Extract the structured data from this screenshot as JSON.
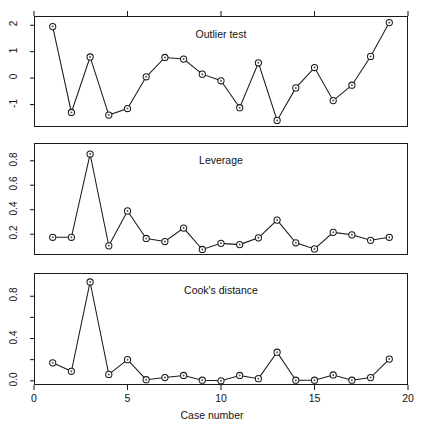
{
  "figure": {
    "xlabel": "Case number",
    "panels": [
      {
        "title": "Outlier test",
        "name": "outlier-test"
      },
      {
        "title": "Leverage",
        "name": "leverage"
      },
      {
        "title": "Cook's distance",
        "name": "cooks-distance"
      }
    ]
  },
  "chart_data": [
    {
      "type": "line",
      "title": "Outlier test",
      "xlabel": "",
      "ylabel": "",
      "x": [
        1,
        2,
        3,
        4,
        5,
        6,
        7,
        8,
        9,
        10,
        11,
        12,
        13,
        14,
        15,
        16,
        17,
        18,
        19
      ],
      "values": [
        1.95,
        -1.3,
        0.8,
        -1.4,
        -1.15,
        0.05,
        0.78,
        0.72,
        0.15,
        -0.1,
        -1.12,
        0.58,
        -1.6,
        -0.37,
        0.4,
        -0.85,
        -0.27,
        0.82,
        2.1
      ],
      "ylim": [
        -1.85,
        2.35
      ],
      "yticks": [
        -1,
        0,
        1,
        2
      ],
      "ytick_labels": [
        "-1",
        "0",
        "1",
        "2"
      ],
      "xlim": [
        0,
        20
      ],
      "xticks": [
        0,
        5,
        10,
        15,
        20
      ],
      "xtick_labels": [
        "",
        "",
        "",
        "",
        ""
      ],
      "grid": false,
      "legend": "none",
      "marker": "open-circle"
    },
    {
      "type": "line",
      "title": "Leverage",
      "xlabel": "",
      "ylabel": "",
      "x": [
        1,
        2,
        3,
        4,
        5,
        6,
        7,
        8,
        9,
        10,
        11,
        12,
        13,
        14,
        15,
        16,
        17,
        18,
        19
      ],
      "values": [
        0.175,
        0.175,
        0.855,
        0.105,
        0.39,
        0.165,
        0.14,
        0.25,
        0.075,
        0.125,
        0.115,
        0.17,
        0.315,
        0.13,
        0.08,
        0.215,
        0.195,
        0.15,
        0.175
      ],
      "ylim": [
        0.03,
        0.945
      ],
      "yticks": [
        0.2,
        0.4,
        0.6,
        0.8
      ],
      "ytick_labels": [
        "0.2",
        "0.4",
        "0.6",
        "0.8"
      ],
      "xlim": [
        0,
        20
      ],
      "xticks": [
        0,
        5,
        10,
        15,
        20
      ],
      "xtick_labels": [
        "",
        "",
        "",
        "",
        ""
      ],
      "grid": false,
      "legend": "none",
      "marker": "open-circle"
    },
    {
      "type": "line",
      "title": "Cook's distance",
      "xlabel": "Case number",
      "ylabel": "",
      "x": [
        1,
        2,
        3,
        4,
        5,
        6,
        7,
        8,
        9,
        10,
        11,
        12,
        13,
        14,
        15,
        16,
        17,
        18,
        19
      ],
      "values": [
        0.17,
        0.09,
        0.935,
        0.06,
        0.2,
        0.01,
        0.03,
        0.05,
        0.005,
        0.0,
        0.05,
        0.02,
        0.27,
        0.005,
        0.005,
        0.055,
        0.005,
        0.03,
        0.205
      ],
      "ylim": [
        -0.04,
        1.02
      ],
      "yticks": [
        0.0,
        0.2,
        0.4,
        0.6,
        0.8
      ],
      "ytick_labels": [
        "0.0",
        "",
        "0.4",
        "",
        "0.8"
      ],
      "xlim": [
        0,
        20
      ],
      "xticks": [
        0,
        5,
        10,
        15,
        20
      ],
      "xtick_labels": [
        "0",
        "5",
        "10",
        "15",
        "20"
      ],
      "grid": false,
      "legend": "none",
      "marker": "open-circle"
    }
  ]
}
